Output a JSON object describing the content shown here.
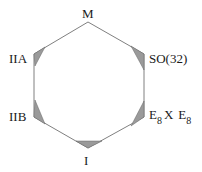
{
  "diagram": {
    "type": "hexagon",
    "vertices": [
      {
        "id": "M",
        "label": "M",
        "shaded": false
      },
      {
        "id": "SO32",
        "label": "SO(32)",
        "shaded": true
      },
      {
        "id": "E8xE8",
        "label": "E",
        "sub": "8",
        "mid": "X",
        "label2": "E",
        "sub2": "8",
        "shaded": true
      },
      {
        "id": "I",
        "label": "I",
        "shaded": true
      },
      {
        "id": "IIB",
        "label": "IIB",
        "shaded": true
      },
      {
        "id": "IIA",
        "label": "IIA",
        "shaded": true
      }
    ],
    "colors": {
      "edge": "#808080",
      "shade": "#9a9a9a",
      "shade_edge": "#555555",
      "text": "#1a1a1a"
    }
  }
}
